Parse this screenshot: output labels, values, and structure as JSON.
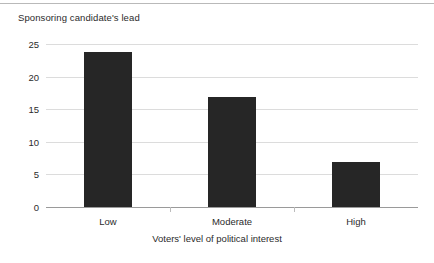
{
  "chart_data": {
    "type": "bar",
    "title": "",
    "categories": [
      "Low",
      "Moderate",
      "High"
    ],
    "values": [
      23.7,
      16.8,
      6.9
    ],
    "series": [
      {
        "name": "Sponsoring candidate's lead",
        "values": [
          23.7,
          16.8,
          6.9
        ]
      }
    ],
    "xlabel": "Voters' level of political interest",
    "ylabel": "Sponsoring candidate's lead",
    "ylim": [
      0,
      25
    ],
    "yticks": [
      0,
      5,
      10,
      15,
      20,
      25
    ],
    "ytick_labels": [
      "0",
      "5",
      "10",
      "15",
      "20",
      "25"
    ],
    "grid": true,
    "grid_axis": "y",
    "legend": false,
    "bar_color": "#262626",
    "grid_color": "#dcdcdc",
    "axis_color": "#9a9a9a",
    "background_color": "#ffffff"
  },
  "axes": {
    "y_title": "Sponsoring candidate's lead",
    "x_title": "Voters' level of political interest",
    "y_tick_labels": [
      "25",
      "20",
      "15",
      "10",
      "5",
      "0"
    ],
    "x_tick_labels": [
      "Low",
      "Moderate",
      "High"
    ]
  }
}
